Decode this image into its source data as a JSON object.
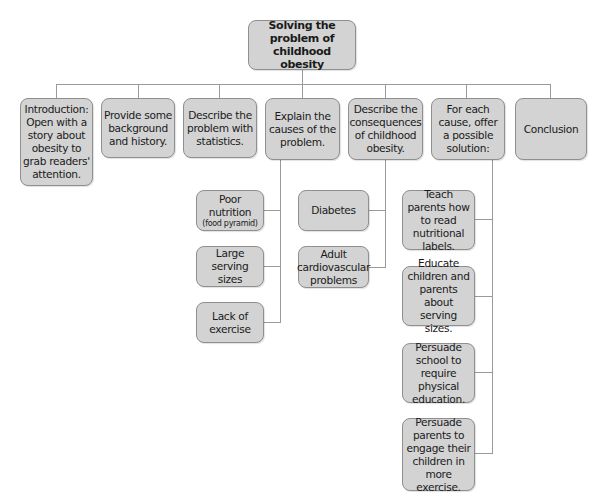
{
  "diagram": {
    "title": "Solving the problem of childhood obesity",
    "colors": {
      "box_fill": "#d3d3d3",
      "box_border": "#8f8f8f",
      "connector": "#9a9a9a",
      "background": "#ffffff"
    },
    "root": {
      "label": "Solving the problem of childhood obesity"
    },
    "sections": [
      {
        "label": "Introduction: Open with a story about obesity to grab readers' attention."
      },
      {
        "label": "Provide some background and history."
      },
      {
        "label": "Describe the problem with statistics."
      },
      {
        "label": "Explain the causes of the problem.",
        "children": [
          {
            "label": "Poor nutrition",
            "note": "(food pyramid)"
          },
          {
            "label": "Large serving sizes"
          },
          {
            "label": "Lack of exercise"
          }
        ]
      },
      {
        "label": "Describe the consequences of childhood obesity.",
        "children": [
          {
            "label": "Diabetes"
          },
          {
            "label": "Adult cardiovascular problems"
          }
        ]
      },
      {
        "label": "For each cause, offer a possible solution:",
        "children": [
          {
            "label": "Teach parents how to read nutritional labels."
          },
          {
            "label": "Educate children and parents about serving sizes."
          },
          {
            "label": "Persuade school to require physical education."
          },
          {
            "label": "Persuade parents to engage their children in more exercise."
          }
        ]
      },
      {
        "label": "Conclusion"
      }
    ]
  }
}
